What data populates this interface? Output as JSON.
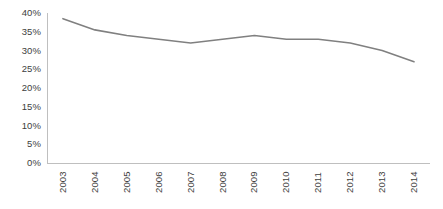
{
  "chart_data": {
    "type": "line",
    "title": "",
    "subtitle": "",
    "xlabel": "",
    "ylabel": "",
    "categories": [
      "2003",
      "2004",
      "2005",
      "2006",
      "2007",
      "2008",
      "2009",
      "2010",
      "2011",
      "2012",
      "2013",
      "2014"
    ],
    "values": [
      38.5,
      35.5,
      34.0,
      33.0,
      32.0,
      33.0,
      34.0,
      33.0,
      33.0,
      32.0,
      30.0,
      27.0
    ],
    "series": [
      {
        "name": "",
        "values": [
          38.5,
          35.5,
          34.0,
          33.0,
          32.0,
          33.0,
          34.0,
          33.0,
          33.0,
          32.0,
          30.0,
          27.0
        ]
      }
    ],
    "ylim": [
      0,
      40
    ],
    "ytick_values": [
      0,
      5,
      10,
      15,
      20,
      25,
      30,
      35,
      40
    ],
    "ytick_labels": [
      "0%",
      "5%",
      "10%",
      "15%",
      "20%",
      "25%",
      "30%",
      "35%",
      "40%"
    ],
    "xtick_labels": [
      "2003",
      "2004",
      "2005",
      "2006",
      "2007",
      "2008",
      "2009",
      "2010",
      "2011",
      "2012",
      "2013",
      "2014"
    ],
    "grid": false,
    "legend": false,
    "legend_position": "none",
    "line_color": "#808080",
    "axis_color": "#bfbfbf",
    "text_color": "#3d3d3d",
    "background_color": "#ffffff",
    "xtick_label_rotation": -90,
    "annotations": []
  }
}
